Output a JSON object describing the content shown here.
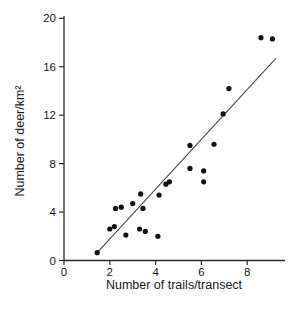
{
  "figure": {
    "background": "#ffffff",
    "axis_color": "#2b2b2b",
    "text_color": "#1a1a1a"
  },
  "chart_data": {
    "type": "scatter",
    "title": "",
    "xlabel": "Number of trails/transect",
    "ylabel": "Number of deer/km²",
    "xlim": [
      0,
      9.65
    ],
    "ylim": [
      0,
      20
    ],
    "x_ticks": [
      0,
      2,
      4,
      6,
      8
    ],
    "y_ticks": [
      0,
      4,
      8,
      12,
      16,
      20
    ],
    "grid": false,
    "legend": "none",
    "point_color": "#111111",
    "point_radius": 2.6,
    "trend_line_color": "#4a4a4a",
    "points": [
      {
        "x": 1.45,
        "y": 0.65
      },
      {
        "x": 2.0,
        "y": 2.6
      },
      {
        "x": 2.2,
        "y": 2.8
      },
      {
        "x": 2.25,
        "y": 4.3
      },
      {
        "x": 2.5,
        "y": 4.4
      },
      {
        "x": 2.7,
        "y": 2.1
      },
      {
        "x": 3.0,
        "y": 4.7
      },
      {
        "x": 3.3,
        "y": 2.6
      },
      {
        "x": 3.35,
        "y": 5.5
      },
      {
        "x": 3.45,
        "y": 4.3
      },
      {
        "x": 3.55,
        "y": 2.4
      },
      {
        "x": 4.1,
        "y": 2.0
      },
      {
        "x": 4.15,
        "y": 5.4
      },
      {
        "x": 4.45,
        "y": 6.3
      },
      {
        "x": 4.6,
        "y": 6.5
      },
      {
        "x": 5.5,
        "y": 7.6
      },
      {
        "x": 5.5,
        "y": 9.5
      },
      {
        "x": 6.1,
        "y": 6.5
      },
      {
        "x": 6.1,
        "y": 7.4
      },
      {
        "x": 6.55,
        "y": 9.6
      },
      {
        "x": 6.95,
        "y": 12.1
      },
      {
        "x": 7.2,
        "y": 14.2
      },
      {
        "x": 8.6,
        "y": 18.4
      },
      {
        "x": 9.1,
        "y": 18.3
      }
    ],
    "trend_line": {
      "x1": 1.45,
      "y1": 0.65,
      "x2": 9.25,
      "y2": 16.7
    }
  }
}
